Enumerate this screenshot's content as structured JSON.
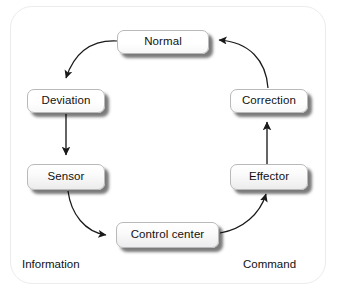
{
  "diagram": {
    "frame": {
      "border_color": "#ececed",
      "background_color": "#ffffff"
    },
    "style": {
      "node_fill_top": "#ffffff",
      "node_fill_bottom": "#ececee",
      "node_border": "#b9b9bb",
      "shadow_color": "rgba(0,0,0,0.52)",
      "arrow_color": "#1a1a1a",
      "text_color": "#111111"
    },
    "nodes": [
      {
        "id": "normal",
        "label": "Normal"
      },
      {
        "id": "deviation",
        "label": "Deviation"
      },
      {
        "id": "sensor",
        "label": "Sensor"
      },
      {
        "id": "control",
        "label": "Control center"
      },
      {
        "id": "effector",
        "label": "Effector"
      },
      {
        "id": "correction",
        "label": "Correction"
      }
    ],
    "zone_labels": [
      {
        "id": "information",
        "label": "Information"
      },
      {
        "id": "command",
        "label": "Command"
      }
    ],
    "edges": [
      {
        "from": "normal",
        "to": "deviation",
        "shape": "curve",
        "direction": "down-left"
      },
      {
        "from": "deviation",
        "to": "sensor",
        "shape": "straight",
        "direction": "down"
      },
      {
        "from": "sensor",
        "to": "control",
        "shape": "curve",
        "direction": "down-right"
      },
      {
        "from": "control",
        "to": "effector",
        "shape": "curve",
        "direction": "up-right"
      },
      {
        "from": "effector",
        "to": "correction",
        "shape": "straight",
        "direction": "up"
      },
      {
        "from": "correction",
        "to": "normal",
        "shape": "curve",
        "direction": "up-left"
      }
    ]
  }
}
